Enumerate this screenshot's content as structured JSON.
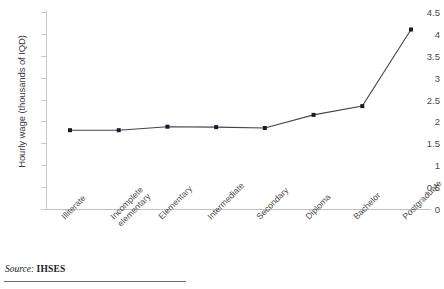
{
  "chart_data": {
    "type": "line",
    "title": "",
    "xlabel": "",
    "ylabel": "Hourly wage (thousands of IQD)",
    "categories": [
      "Illiterate",
      "Incomplete elementary",
      "Elementary",
      "Intermediate",
      "Secondary",
      "Diploma",
      "Bachelor",
      "Postgraduate"
    ],
    "category_lines": [
      [
        "Illiterate"
      ],
      [
        "Incomplete",
        "elementary"
      ],
      [
        "Elementary"
      ],
      [
        "Intermediate"
      ],
      [
        "Secondary"
      ],
      [
        "Diploma"
      ],
      [
        "Bachelor"
      ],
      [
        "Postgraduate"
      ]
    ],
    "values": [
      1.8,
      1.8,
      1.88,
      1.87,
      1.85,
      2.15,
      2.35,
      4.1
    ],
    "ylim": [
      0,
      4.5
    ],
    "yticks": [
      0,
      0.5,
      1,
      1.5,
      2,
      2.5,
      3,
      3.5,
      4,
      4.5
    ],
    "ytick_labels": [
      "0",
      "0.5",
      "1",
      "1.5",
      "2",
      "2.5",
      "3",
      "3.5",
      "4",
      "4.5"
    ],
    "grid": false,
    "legend": "none",
    "series_color": "#44444f",
    "marker_color": "#1a1a2e",
    "axis_color": "#c9c9c9"
  },
  "source": {
    "label": "Source:",
    "value": "IHSES"
  }
}
